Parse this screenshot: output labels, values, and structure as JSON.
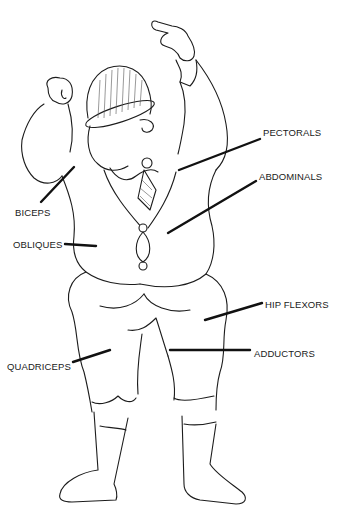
{
  "diagram": {
    "labels": [
      {
        "id": "pectorals",
        "text": "PECTORALS",
        "x": 263,
        "y": 133
      },
      {
        "id": "abdominals",
        "text": "ABDOMINALS",
        "x": 259,
        "y": 175
      },
      {
        "id": "biceps",
        "text": "BICEPS",
        "x": 15,
        "y": 205
      },
      {
        "id": "obliques",
        "text": "OBLIQUES",
        "x": 13,
        "y": 238
      },
      {
        "id": "hip-flexors",
        "text": "HIP FLEXORS",
        "x": 265,
        "y": 300
      },
      {
        "id": "adductors",
        "text": "ADDUCTORS",
        "x": 254,
        "y": 348
      },
      {
        "id": "quadriceps",
        "text": "QUADRICEPS",
        "x": 7,
        "y": 362
      }
    ],
    "colors": {
      "ink": "#1c1c1c",
      "background": "#ffffff"
    }
  }
}
